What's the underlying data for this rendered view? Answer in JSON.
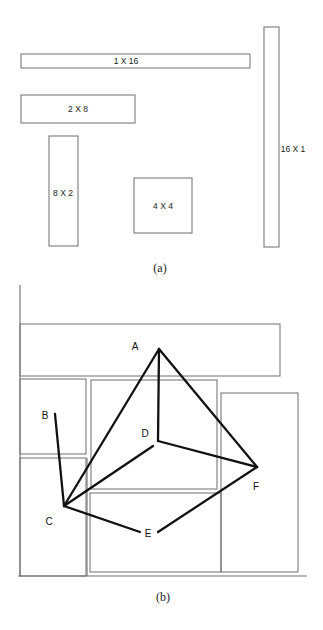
{
  "figure_a": {
    "caption": "(a)",
    "caption_pos": [
      160,
      272
    ],
    "rects": [
      {
        "id": "rect-1x16",
        "label": "1 X 16",
        "x": 21,
        "y": 54,
        "w": 229,
        "h": 14,
        "label_pos": [
          126,
          64
        ]
      },
      {
        "id": "rect-2x8",
        "label": "2 X 8",
        "x": 21,
        "y": 95,
        "w": 114,
        "h": 28,
        "label_pos": [
          78,
          112
        ]
      },
      {
        "id": "rect-8x2",
        "label": "8 X 2",
        "x": 49,
        "y": 136,
        "w": 29,
        "h": 110,
        "label_pos": [
          63,
          196
        ]
      },
      {
        "id": "rect-4x4",
        "label": "4 X 4",
        "x": 134,
        "y": 178,
        "w": 58,
        "h": 55,
        "label_pos": [
          163,
          209
        ]
      },
      {
        "id": "rect-16x1",
        "label": "16 X 1",
        "x": 264,
        "y": 27,
        "w": 15,
        "h": 220,
        "label_pos": [
          293,
          152
        ]
      }
    ]
  },
  "figure_b": {
    "caption": "(b)",
    "caption_pos": [
      163,
      601
    ],
    "axes": {
      "vertical": [
        20,
        285,
        20,
        576
      ],
      "baseline": [
        18,
        576,
        307,
        576
      ],
      "divider": [
        87,
        458,
        87,
        576
      ]
    },
    "rects": [
      {
        "id": "top-wide",
        "x": 20,
        "y": 324,
        "w": 260,
        "h": 52
      },
      {
        "id": "left-upper",
        "x": 20,
        "y": 379,
        "w": 66,
        "h": 75
      },
      {
        "id": "left-lower",
        "x": 20,
        "y": 458,
        "w": 66,
        "h": 118
      },
      {
        "id": "center-upper",
        "x": 91,
        "y": 380,
        "w": 126,
        "h": 109
      },
      {
        "id": "center-lower",
        "x": 90,
        "y": 493,
        "w": 131,
        "h": 79
      },
      {
        "id": "right-tall",
        "x": 221,
        "y": 393,
        "w": 77,
        "h": 179
      }
    ],
    "nodes": [
      {
        "id": "A",
        "label": "A",
        "label_pos": [
          135,
          350
        ]
      },
      {
        "id": "B",
        "label": "B",
        "label_pos": [
          45,
          419
        ]
      },
      {
        "id": "C",
        "label": "C",
        "label_pos": [
          49,
          525
        ]
      },
      {
        "id": "D",
        "label": "D",
        "label_pos": [
          145,
          437
        ]
      },
      {
        "id": "E",
        "label": "E",
        "label_pos": [
          148,
          537
        ]
      },
      {
        "id": "F",
        "label": "F",
        "label_pos": [
          256,
          490
        ]
      }
    ],
    "edges": [
      {
        "id": "A-C",
        "points": [
          [
            159,
            349
          ],
          [
            64,
            506
          ]
        ]
      },
      {
        "id": "A-D",
        "points": [
          [
            159,
            349
          ],
          [
            158,
            441
          ]
        ]
      },
      {
        "id": "A-F",
        "points": [
          [
            159,
            349
          ],
          [
            257,
            467
          ]
        ]
      },
      {
        "id": "D-F",
        "points": [
          [
            158,
            441
          ],
          [
            257,
            467
          ]
        ]
      },
      {
        "id": "B-C",
        "points": [
          [
            55,
            414
          ],
          [
            64,
            506
          ]
        ]
      },
      {
        "id": "C-D",
        "points": [
          [
            64,
            506
          ],
          [
            153,
            446
          ]
        ]
      },
      {
        "id": "C-E",
        "points": [
          [
            64,
            506
          ],
          [
            140,
            532
          ]
        ]
      },
      {
        "id": "E-F",
        "points": [
          [
            158,
            532
          ],
          [
            257,
            467
          ]
        ]
      }
    ]
  }
}
